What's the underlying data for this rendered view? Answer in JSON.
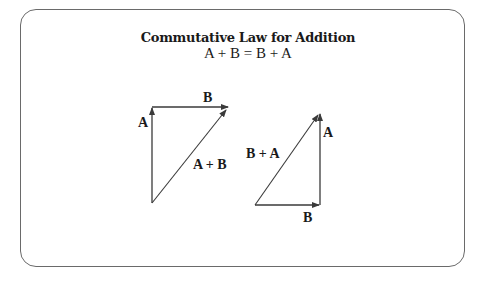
{
  "title": "Commutative Law for Addition",
  "equation": "A + B = B + A",
  "colors": {
    "stroke": "#3a3a3a",
    "text": "#1a1a1a",
    "frame": "#6a6a6a"
  },
  "left_triangle": {
    "vector_a_label": "A",
    "vector_b_label": "B",
    "resultant_label": "A + B"
  },
  "right_triangle": {
    "vector_a_label": "A",
    "vector_b_label": "B",
    "resultant_label": "B + A"
  }
}
